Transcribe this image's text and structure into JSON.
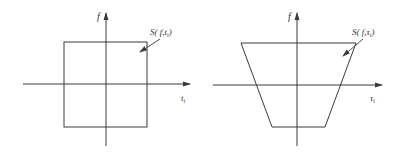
{
  "diagrams": [
    {
      "name": "rectangle-support",
      "y_axis_label": "f",
      "x_axis_label_main": "t",
      "x_axis_label_sub": "i",
      "region_label": "S( f,t",
      "region_label_sub": "i",
      "region_label_close": ")",
      "shape": "rectangle"
    },
    {
      "name": "trapezoid-support",
      "y_axis_label": "f",
      "x_axis_label_main": "τ",
      "x_axis_label_sub": "i",
      "region_label": "S( f,τ",
      "region_label_sub": "i",
      "region_label_close": ")",
      "shape": "trapezoid"
    }
  ],
  "colors": {
    "line": "#3a3a3a",
    "background": "#ffffff"
  }
}
